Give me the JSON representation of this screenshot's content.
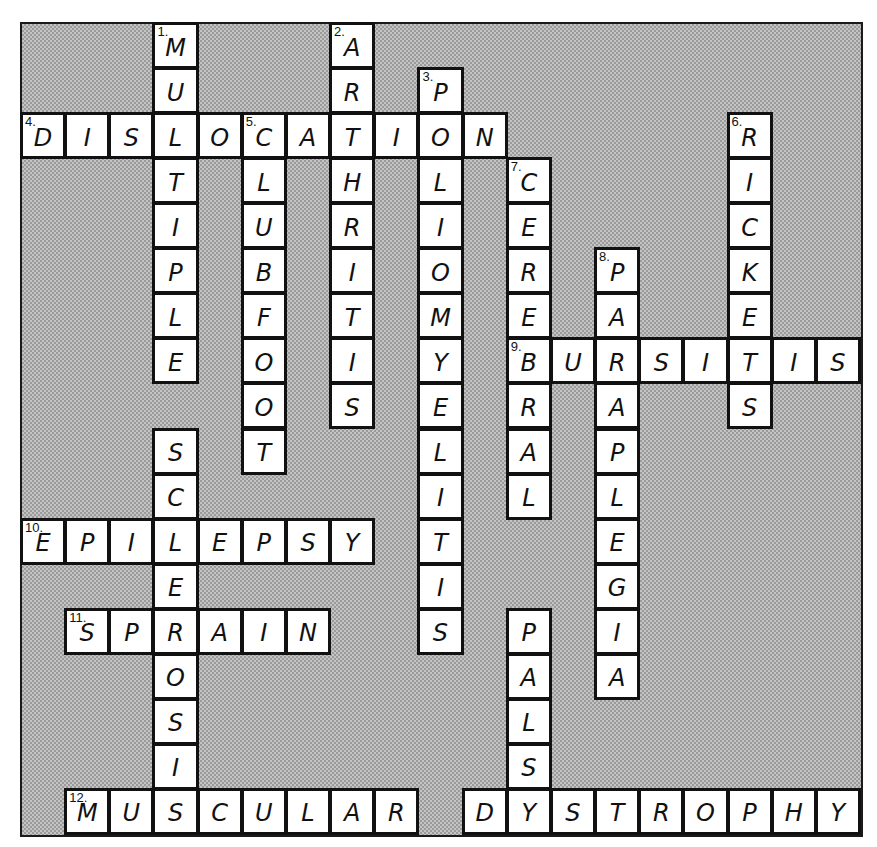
{
  "grid": {
    "columns": 19,
    "rows": 18
  },
  "colors": {
    "cell_fill": "#ffffff",
    "cell_border": "#111111",
    "blocked_fill": "#b4b4b4"
  },
  "entries": [
    {
      "number": 1,
      "direction": "down",
      "answer": "MULTIPLE",
      "row": 0,
      "col": 3
    },
    {
      "number": 2,
      "direction": "down",
      "answer": "ARTHRITIS",
      "row": 0,
      "col": 7
    },
    {
      "number": 3,
      "direction": "down",
      "answer": "POLIOMYELITIS",
      "row": 1,
      "col": 9
    },
    {
      "number": 4,
      "direction": "across",
      "answer": "DISLOCATION",
      "row": 2,
      "col": 0
    },
    {
      "number": 5,
      "direction": "down",
      "answer": "CLUBFOOT",
      "row": 2,
      "col": 5
    },
    {
      "number": 6,
      "direction": "down",
      "answer": "RICKETS",
      "row": 2,
      "col": 16
    },
    {
      "number": 7,
      "direction": "down",
      "answer": "CEREBRAL",
      "row": 3,
      "col": 11
    },
    {
      "number": 8,
      "direction": "down",
      "answer": "PARAPLEGIA",
      "row": 5,
      "col": 13
    },
    {
      "number": 9,
      "direction": "across",
      "answer": "BURSITIS",
      "row": 7,
      "col": 11
    },
    {
      "number": null,
      "direction": "down",
      "answer": "SCLEROSIS",
      "row": 9,
      "col": 3
    },
    {
      "number": 10,
      "direction": "across",
      "answer": "EPILEPSY",
      "row": 11,
      "col": 0
    },
    {
      "number": 11,
      "direction": "across",
      "answer": "SPRAIN",
      "row": 13,
      "col": 1
    },
    {
      "number": null,
      "direction": "down",
      "answer": "PALSY",
      "row": 13,
      "col": 11
    },
    {
      "number": 12,
      "direction": "across",
      "answer": "MUSCULAR",
      "row": 17,
      "col": 1
    },
    {
      "number": null,
      "direction": "across",
      "answer": "DYSTROPHY",
      "row": 17,
      "col": 10
    }
  ]
}
